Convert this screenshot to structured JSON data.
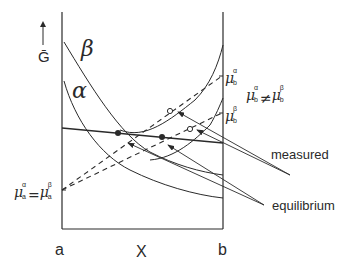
{
  "axis": {
    "y_label": "Ḡ",
    "x_label": "X",
    "left_end": "a",
    "right_end": "b"
  },
  "phases": {
    "beta": "β",
    "alpha": "α"
  },
  "chemical_potentials": {
    "mu_b_alpha": {
      "symbol": "μ",
      "sup": "α",
      "sub": "b"
    },
    "mu_b_beta": {
      "symbol": "μ",
      "sup": "β",
      "sub": "b"
    },
    "inequality": {
      "left_sup": "α",
      "left_sub": "b",
      "op": "≠",
      "right_sup": "β",
      "right_sub": "b"
    },
    "equality_a": {
      "left_sup": "α",
      "left_sub": "a",
      "op": "=",
      "right_sup": "β",
      "right_sub": "a"
    }
  },
  "annotations": {
    "measured": "measured",
    "equilibrium": "equilibrium"
  },
  "colors": {
    "ink": "#2a2a2a",
    "background": "#ffffff"
  }
}
